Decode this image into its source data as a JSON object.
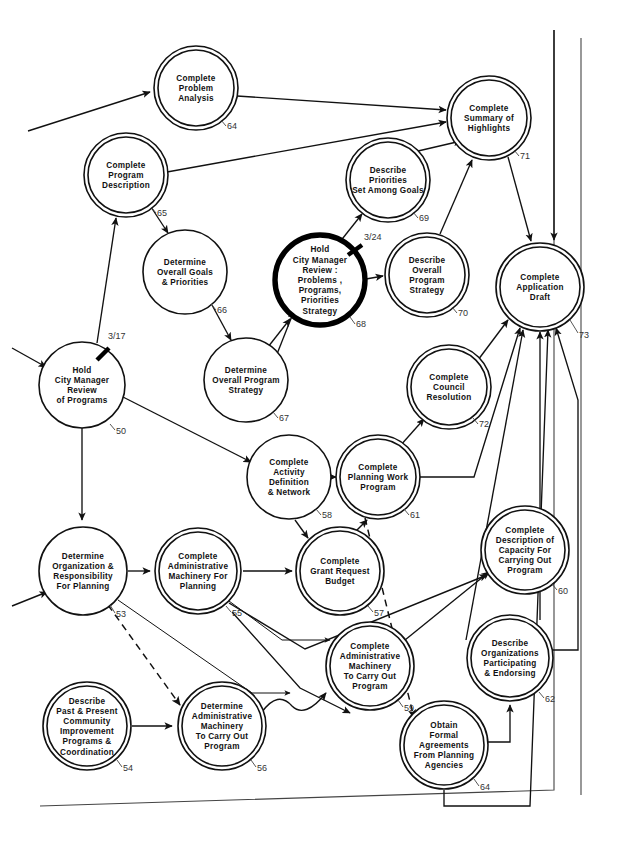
{
  "diagram": {
    "type": "pert-network-flowchart",
    "background_color": "#ffffff",
    "line_color": "#111111",
    "nodes": [
      {
        "id": "n64top",
        "number": "64",
        "label_lines": [
          "Complete",
          "Problem",
          "Analysis"
        ],
        "cx": 196,
        "cy": 88,
        "r": 42,
        "style": "double",
        "num_x": 227,
        "num_y": 129,
        "leader": "M 221,120 L 226,126"
      },
      {
        "id": "n65",
        "number": "65",
        "label_lines": [
          "Complete",
          "Program",
          "Description"
        ],
        "cx": 126,
        "cy": 175,
        "r": 42,
        "style": "double",
        "num_x": 157,
        "num_y": 216,
        "leader": "M 151,207 L 156,213"
      },
      {
        "id": "n66",
        "number": "66",
        "label_lines": [
          "Determine",
          "Overall  Goals",
          "& Priorities"
        ],
        "cx": 185,
        "cy": 272,
        "r": 42,
        "style": "single",
        "num_x": 217,
        "num_y": 313,
        "leader": "M 211,304 L 216,310"
      },
      {
        "id": "n68",
        "number": "68",
        "label_lines": [
          "Hold",
          "City  Manager",
          "Review :",
          "Problems ,",
          "Programs,",
          "Priorities",
          "Strategy"
        ],
        "cx": 320,
        "cy": 280,
        "r": 45,
        "style": "bold",
        "num_x": 356,
        "num_y": 327,
        "leader": "M 350,317 L 355,324",
        "date": "3/24",
        "date_x": 364,
        "date_y": 240,
        "tick": "M 348,255 L 362,245"
      },
      {
        "id": "n69",
        "number": "69",
        "label_lines": [
          "Describe",
          "Priorities",
          "Set Among  Goals"
        ],
        "cx": 388,
        "cy": 180,
        "r": 42,
        "style": "double",
        "num_x": 419,
        "num_y": 221,
        "leader": "M 413,212 L 418,218"
      },
      {
        "id": "n71",
        "number": "71",
        "label_lines": [
          "Complete",
          "Summary of",
          "Highlights"
        ],
        "cx": 489,
        "cy": 118,
        "r": 42,
        "style": "double",
        "num_x": 520,
        "num_y": 159,
        "leader": "M 514,150 L 519,156"
      },
      {
        "id": "n70",
        "number": "70",
        "label_lines": [
          "Describe",
          "Overall",
          "Program",
          "Strategy"
        ],
        "cx": 427,
        "cy": 275,
        "r": 42,
        "style": "double",
        "num_x": 458,
        "num_y": 316,
        "leader": "M 452,307 L 457,313"
      },
      {
        "id": "n73",
        "number": "73",
        "label_lines": [
          "Complete",
          "Application",
          "Draft"
        ],
        "cx": 540,
        "cy": 287,
        "r": 44,
        "style": "double",
        "num_x": 579,
        "num_y": 338,
        "leader": "M 570,320 L 578,333"
      },
      {
        "id": "n50",
        "number": "50",
        "label_lines": [
          "Hold",
          "City  Manager",
          "Review",
          "of  Programs"
        ],
        "cx": 82,
        "cy": 385,
        "r": 43,
        "style": "single",
        "num_x": 116,
        "num_y": 434,
        "leader": "M 110,424 L 115,430",
        "date": "3/17",
        "date_x": 108,
        "date_y": 339,
        "tick": "M 97,360 L 109,348"
      },
      {
        "id": "n67",
        "number": "67",
        "label_lines": [
          "Determine",
          "Overall  Program",
          "Strategy"
        ],
        "cx": 246,
        "cy": 380,
        "r": 42,
        "style": "single",
        "num_x": 279,
        "num_y": 421,
        "leader": "M 273,412 L 278,418"
      },
      {
        "id": "n72",
        "number": "72",
        "label_lines": [
          "Complete",
          "Council",
          "Resolution"
        ],
        "cx": 449,
        "cy": 387,
        "r": 42,
        "style": "double",
        "num_x": 479,
        "num_y": 427,
        "leader": "M 473,418 L 478,424"
      },
      {
        "id": "n58",
        "number": "58",
        "label_lines": [
          "Complete",
          "Activity",
          "Definition",
          "& Network"
        ],
        "cx": 289,
        "cy": 477,
        "r": 42,
        "style": "single",
        "num_x": 322,
        "num_y": 518,
        "leader": "M 316,509 L 321,515"
      },
      {
        "id": "n61",
        "number": "61",
        "label_lines": [
          "Complete",
          "Planning Work",
          "Program"
        ],
        "cx": 378,
        "cy": 477,
        "r": 42,
        "style": "double",
        "num_x": 410,
        "num_y": 518,
        "leader": "M 404,509 L 409,515"
      },
      {
        "id": "n60",
        "number": "60",
        "label_lines": [
          "Complete",
          "Description of",
          "Capacity For",
          "Carrying Out",
          "Program"
        ],
        "cx": 525,
        "cy": 550,
        "r": 44,
        "style": "double",
        "num_x": 558,
        "num_y": 594,
        "leader": "M 552,584 L 557,590"
      },
      {
        "id": "n53",
        "number": "53",
        "label_lines": [
          "Determine",
          "Organization &",
          "Responsibility",
          "For  Planning"
        ],
        "cx": 83,
        "cy": 571,
        "r": 44,
        "style": "single",
        "num_x": 116,
        "num_y": 617,
        "leader": "M 110,605 L 115,613"
      },
      {
        "id": "n55",
        "number": "55",
        "label_lines": [
          "Complete",
          "Administrative",
          "Machinery For",
          "Planning"
        ],
        "cx": 198,
        "cy": 571,
        "r": 43,
        "style": "double",
        "num_x": 232,
        "num_y": 616,
        "leader": "M 226,606 L 231,612"
      },
      {
        "id": "n57",
        "number": "57",
        "label_lines": [
          "Complete",
          "Grant  Request",
          "Budget"
        ],
        "cx": 340,
        "cy": 571,
        "r": 44,
        "style": "double",
        "num_x": 374,
        "num_y": 616,
        "leader": "M 368,606 L 373,612"
      },
      {
        "id": "n62",
        "number": "62",
        "label_lines": [
          "Describe",
          "Organizations",
          "Participating",
          "& Endorsing"
        ],
        "cx": 510,
        "cy": 658,
        "r": 43,
        "style": "double",
        "num_x": 545,
        "num_y": 702,
        "leader": "M 539,692 L 544,698"
      },
      {
        "id": "n59",
        "number": "59",
        "label_lines": [
          "Complete",
          "Administrative",
          "Machinery",
          "To Carry Out",
          "Program"
        ],
        "cx": 370,
        "cy": 666,
        "r": 44,
        "style": "double",
        "num_x": 404,
        "num_y": 711,
        "leader": "M 398,700 L 403,707"
      },
      {
        "id": "n54",
        "number": "54",
        "label_lines": [
          "Describe",
          "Past & Present",
          "Community",
          "Improvement",
          "Programs &",
          "Coordination"
        ],
        "cx": 87,
        "cy": 726,
        "r": 44,
        "style": "double",
        "num_x": 123,
        "num_y": 771,
        "leader": "M 117,760 L 122,767"
      },
      {
        "id": "n56",
        "number": "56",
        "label_lines": [
          "Determine",
          "Administrative",
          "Machinery",
          "To Carry Out",
          "Program"
        ],
        "cx": 222,
        "cy": 726,
        "r": 44,
        "style": "double",
        "num_x": 257,
        "num_y": 771,
        "leader": "M 251,760 L 256,767"
      },
      {
        "id": "n64bot",
        "number": "64",
        "label_lines": [
          "Obtain",
          "Formal",
          "Agreements",
          "From  Planning",
          "Agencies"
        ],
        "cx": 444,
        "cy": 745,
        "r": 44,
        "style": "double",
        "num_x": 480,
        "num_y": 790,
        "leader": "M 474,779 L 479,786"
      }
    ],
    "milestone_dates": [
      "3/17",
      "3/24"
    ],
    "node_count": 22
  }
}
